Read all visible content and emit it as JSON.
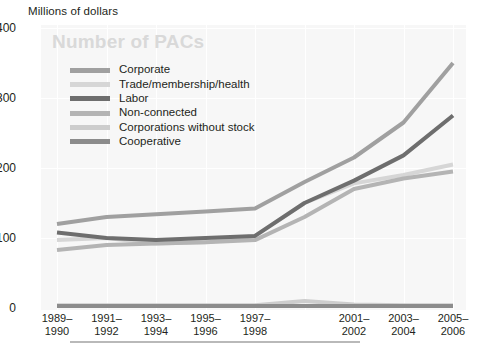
{
  "axis_unit_label": "Millions of dollars",
  "watermark_title": "Number of PACs",
  "legend": {
    "items": [
      {
        "label": "Corporate",
        "color": "#a0a0a0"
      },
      {
        "label": "Trade/membership/health",
        "color": "#d6d6d6"
      },
      {
        "label": "Labor",
        "color": "#6e6e6e"
      },
      {
        "label": "Non-connected",
        "color": "#b4b4b4"
      },
      {
        "label": "Corporations without stock",
        "color": "#cdcdcd"
      },
      {
        "label": "Cooperative",
        "color": "#8c8c8c"
      }
    ]
  },
  "y_ticks": [
    "400",
    "300",
    "200",
    "100",
    "0"
  ],
  "x_ticks": [
    "1989–\n1990",
    "1991–\n1992",
    "1993–\n1994",
    "1995–\n1996",
    "1997–\n1998",
    "",
    "2001–\n2002",
    "2003–\n2004",
    "2005–\n2006"
  ],
  "chart_data": {
    "type": "line",
    "title": "Number of PACs",
    "xlabel": "",
    "ylabel": "Millions of dollars",
    "ylim": [
      0,
      400
    ],
    "ytick_values": [
      0,
      100,
      200,
      300,
      400
    ],
    "grid": true,
    "legend_position": "inside-top-left",
    "categories": [
      "1989-1990",
      "1991-1992",
      "1993-1994",
      "1995-1996",
      "1997-1998",
      "1999-2000",
      "2001-2002",
      "2003-2004",
      "2005-2006"
    ],
    "series": [
      {
        "name": "Corporate",
        "color": "#a0a0a0",
        "values": [
          120,
          130,
          134,
          138,
          142,
          180,
          215,
          265,
          350
        ]
      },
      {
        "name": "Trade/membership/health",
        "color": "#d6d6d6",
        "values": [
          97,
          100,
          92,
          94,
          103,
          150,
          178,
          190,
          205
        ]
      },
      {
        "name": "Labor",
        "color": "#6e6e6e",
        "values": [
          108,
          100,
          97,
          100,
          103,
          150,
          182,
          218,
          275
        ]
      },
      {
        "name": "Non-connected",
        "color": "#b4b4b4",
        "values": [
          83,
          90,
          92,
          94,
          97,
          130,
          170,
          185,
          195
        ]
      },
      {
        "name": "Corporations without stock",
        "color": "#cdcdcd",
        "values": [
          4,
          4,
          4,
          4,
          4,
          10,
          5,
          4,
          4
        ]
      },
      {
        "name": "Cooperative",
        "color": "#8c8c8c",
        "values": [
          3,
          3,
          3,
          3,
          3,
          3,
          3,
          3,
          3
        ]
      }
    ]
  },
  "plot_geometry": {
    "left": 41,
    "top": 25,
    "width": 425,
    "height": 285,
    "y_zero_px": 308,
    "y_per_100_px": 70,
    "x_first_px": 57,
    "x_step_px": 49.5
  }
}
